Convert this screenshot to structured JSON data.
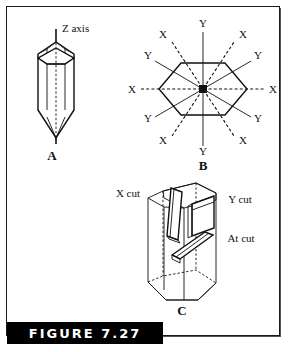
{
  "figure": {
    "caption_label": "FIGURE 7.27",
    "frame_color": "#1a1a1a",
    "caption_bg": "#000000",
    "caption_fg": "#ffffff",
    "line_color": "#111111",
    "background": "#ffffff"
  },
  "panels": [
    {
      "id": "A",
      "label": "A",
      "title": "Quartz crystal showing Z axis",
      "annotations": [
        {
          "name": "z-axis-label",
          "text": "Z axis"
        }
      ]
    },
    {
      "id": "B",
      "label": "B",
      "title": "Cross section of quartz crystal with X and Y axes",
      "axis_labels": [
        {
          "name": "axis-label-y-top",
          "text": "Y",
          "x": 203,
          "y": 27,
          "kind": "Y"
        },
        {
          "name": "axis-label-x-upper-left",
          "text": "X",
          "x": 163,
          "y": 38,
          "kind": "X"
        },
        {
          "name": "axis-label-x-upper-right",
          "text": "X",
          "x": 243,
          "y": 38,
          "kind": "X"
        },
        {
          "name": "axis-label-y-upper-left",
          "text": "Y",
          "x": 148,
          "y": 59,
          "kind": "Y"
        },
        {
          "name": "axis-label-y-upper-right",
          "text": "Y",
          "x": 258,
          "y": 59,
          "kind": "Y"
        },
        {
          "name": "axis-label-x-left",
          "text": "X",
          "x": 132,
          "y": 89,
          "kind": "X"
        },
        {
          "name": "axis-label-x-right",
          "text": "X",
          "x": 273,
          "y": 89,
          "kind": "X"
        },
        {
          "name": "axis-label-y-lower-left",
          "text": "Y",
          "x": 148,
          "y": 118,
          "kind": "Y"
        },
        {
          "name": "axis-label-y-lower-right",
          "text": "Y",
          "x": 258,
          "y": 118,
          "kind": "Y"
        },
        {
          "name": "axis-label-x-lower-left",
          "text": "X",
          "x": 163,
          "y": 140,
          "kind": "X"
        },
        {
          "name": "axis-label-x-lower-right",
          "text": "X",
          "x": 243,
          "y": 140,
          "kind": "X"
        },
        {
          "name": "axis-label-y-bottom",
          "text": "Y",
          "x": 203,
          "y": 151,
          "kind": "Y"
        }
      ]
    },
    {
      "id": "C",
      "label": "C",
      "title": "Quartz crystal showing X cut, Y cut and At cut plates",
      "annotations": [
        {
          "name": "x-cut-label",
          "text": "X cut"
        },
        {
          "name": "y-cut-label",
          "text": "Y cut"
        },
        {
          "name": "at-cut-label",
          "text": "At cut"
        }
      ]
    }
  ]
}
